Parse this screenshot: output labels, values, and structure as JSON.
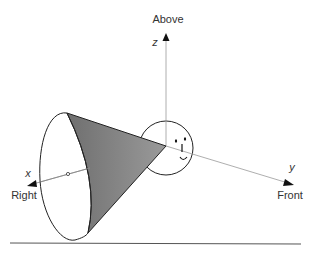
{
  "diagram": {
    "labels": {
      "above": "Above",
      "z": "z",
      "x": "x",
      "right": "Right",
      "y": "y",
      "front": "Front"
    },
    "colors": {
      "cone_fill": "#8c8c8c",
      "stroke": "#222222",
      "axis": "#888888"
    }
  }
}
